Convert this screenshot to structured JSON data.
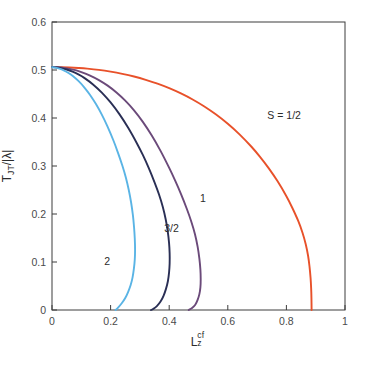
{
  "chart_data": {
    "type": "line",
    "title": "",
    "xlabel": "L_z^cf",
    "xlabel_parts": {
      "base": "L",
      "sub": "z",
      "sup": "cf"
    },
    "ylabel": "T_JT/|λ|",
    "ylabel_parts": {
      "base": "T",
      "sub": "JT",
      "denom": "|λ|"
    },
    "xlim": [
      0,
      1
    ],
    "ylim": [
      0,
      0.6
    ],
    "xticks": [
      0,
      0.2,
      0.4,
      0.6,
      0.8,
      1
    ],
    "xtick_labels": [
      "0",
      "0.2",
      "0.4",
      "0.6",
      "0.8",
      "1"
    ],
    "yticks": [
      0,
      0.1,
      0.2,
      0.3,
      0.4,
      0.5,
      0.6
    ],
    "ytick_labels": [
      "0",
      "0.1",
      "0.2",
      "0.3",
      "0.4",
      "0.5",
      "0.6"
    ],
    "grid": false,
    "legend_position": "inline-annotations",
    "background": "#ffffff",
    "axis_color": "#3d3d3d",
    "series": [
      {
        "name": "S = 1/2",
        "label": "S = 1/2",
        "color": "#e8512a",
        "label_x": 0.735,
        "label_y": 0.405,
        "points": [
          [
            0.0,
            0.506
          ],
          [
            0.03,
            0.5058
          ],
          [
            0.06,
            0.5052
          ],
          [
            0.09,
            0.5042
          ],
          [
            0.12,
            0.5028
          ],
          [
            0.16,
            0.5002
          ],
          [
            0.2,
            0.4966
          ],
          [
            0.24,
            0.492
          ],
          [
            0.28,
            0.4864
          ],
          [
            0.32,
            0.4796
          ],
          [
            0.36,
            0.4716
          ],
          [
            0.4,
            0.4622
          ],
          [
            0.44,
            0.4512
          ],
          [
            0.48,
            0.4386
          ],
          [
            0.52,
            0.424
          ],
          [
            0.56,
            0.4072
          ],
          [
            0.6,
            0.388
          ],
          [
            0.64,
            0.366
          ],
          [
            0.68,
            0.3406
          ],
          [
            0.71,
            0.319
          ],
          [
            0.74,
            0.295
          ],
          [
            0.77,
            0.268
          ],
          [
            0.8,
            0.237
          ],
          [
            0.82,
            0.213
          ],
          [
            0.84,
            0.186
          ],
          [
            0.855,
            0.161
          ],
          [
            0.866,
            0.137
          ],
          [
            0.874,
            0.113
          ],
          [
            0.879,
            0.09
          ],
          [
            0.8825,
            0.067
          ],
          [
            0.8845,
            0.045
          ],
          [
            0.8855,
            0.024
          ],
          [
            0.886,
            0.0
          ]
        ]
      },
      {
        "name": "S = 1",
        "label": "1",
        "color": "#6b4a7a",
        "label_x": 0.505,
        "label_y": 0.232,
        "points": [
          [
            0.0,
            0.506
          ],
          [
            0.02,
            0.5056
          ],
          [
            0.04,
            0.5044
          ],
          [
            0.06,
            0.5024
          ],
          [
            0.08,
            0.4996
          ],
          [
            0.1,
            0.4958
          ],
          [
            0.13,
            0.4884
          ],
          [
            0.16,
            0.479
          ],
          [
            0.19,
            0.4674
          ],
          [
            0.22,
            0.4532
          ],
          [
            0.25,
            0.4362
          ],
          [
            0.28,
            0.416
          ],
          [
            0.31,
            0.392
          ],
          [
            0.34,
            0.364
          ],
          [
            0.37,
            0.332
          ],
          [
            0.4,
            0.296
          ],
          [
            0.42,
            0.27
          ],
          [
            0.44,
            0.242
          ],
          [
            0.46,
            0.211
          ],
          [
            0.475,
            0.185
          ],
          [
            0.488,
            0.158
          ],
          [
            0.497,
            0.132
          ],
          [
            0.503,
            0.107
          ],
          [
            0.5065,
            0.084
          ],
          [
            0.5075,
            0.064
          ],
          [
            0.5065,
            0.047
          ],
          [
            0.503,
            0.033
          ],
          [
            0.497,
            0.021
          ],
          [
            0.489,
            0.011
          ],
          [
            0.478,
            0.004
          ],
          [
            0.4665,
            0.0
          ]
        ]
      },
      {
        "name": "S = 3/2",
        "label": "3/2",
        "color": "#2a2f55",
        "label_x": 0.383,
        "label_y": 0.168,
        "points": [
          [
            0.0,
            0.506
          ],
          [
            0.015,
            0.5054
          ],
          [
            0.03,
            0.504
          ],
          [
            0.05,
            0.501
          ],
          [
            0.07,
            0.4966
          ],
          [
            0.09,
            0.4908
          ],
          [
            0.11,
            0.4836
          ],
          [
            0.14,
            0.47
          ],
          [
            0.17,
            0.453
          ],
          [
            0.2,
            0.4324
          ],
          [
            0.23,
            0.408
          ],
          [
            0.26,
            0.3796
          ],
          [
            0.29,
            0.347
          ],
          [
            0.31,
            0.323
          ],
          [
            0.33,
            0.296
          ],
          [
            0.35,
            0.266
          ],
          [
            0.365,
            0.241
          ],
          [
            0.378,
            0.215
          ],
          [
            0.388,
            0.189
          ],
          [
            0.395,
            0.164
          ],
          [
            0.3995,
            0.14
          ],
          [
            0.4015,
            0.118
          ],
          [
            0.4015,
            0.097
          ],
          [
            0.3995,
            0.078
          ],
          [
            0.3955,
            0.06
          ],
          [
            0.389,
            0.044
          ],
          [
            0.381,
            0.03
          ],
          [
            0.371,
            0.018
          ],
          [
            0.358,
            0.008
          ],
          [
            0.345,
            0.002
          ],
          [
            0.338,
            0.0
          ]
        ]
      },
      {
        "name": "S = 2",
        "label": "2",
        "color": "#5ab4e5",
        "label_x": 0.178,
        "label_y": 0.1,
        "points": [
          [
            0.0,
            0.506
          ],
          [
            0.012,
            0.505
          ],
          [
            0.025,
            0.503
          ],
          [
            0.04,
            0.4994
          ],
          [
            0.055,
            0.4944
          ],
          [
            0.07,
            0.488
          ],
          [
            0.09,
            0.4772
          ],
          [
            0.11,
            0.464
          ],
          [
            0.13,
            0.448
          ],
          [
            0.15,
            0.429
          ],
          [
            0.17,
            0.407
          ],
          [
            0.19,
            0.3816
          ],
          [
            0.21,
            0.3526
          ],
          [
            0.225,
            0.328
          ],
          [
            0.24,
            0.301
          ],
          [
            0.252,
            0.276
          ],
          [
            0.262,
            0.25
          ],
          [
            0.27,
            0.224
          ],
          [
            0.276,
            0.198
          ],
          [
            0.28,
            0.173
          ],
          [
            0.2825,
            0.149
          ],
          [
            0.2835,
            0.126
          ],
          [
            0.2825,
            0.105
          ],
          [
            0.2795,
            0.086
          ],
          [
            0.275,
            0.068
          ],
          [
            0.2685,
            0.052
          ],
          [
            0.26,
            0.038
          ],
          [
            0.25,
            0.025
          ],
          [
            0.238,
            0.014
          ],
          [
            0.2255,
            0.005
          ],
          [
            0.217,
            0.0
          ]
        ]
      }
    ]
  },
  "axes": {
    "x_axis_name": "x-axis",
    "y_axis_name": "y-axis"
  }
}
